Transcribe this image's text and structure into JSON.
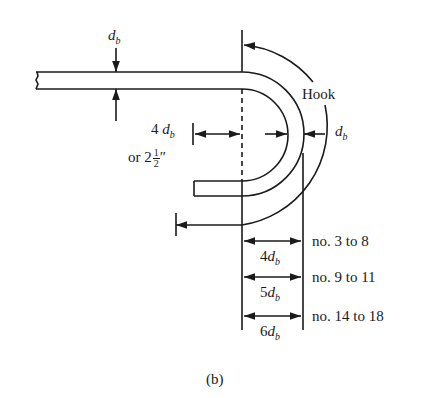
{
  "figure": {
    "panel_label": "(b)",
    "bar_diameter_symbol": "d",
    "bar_diameter_subscript": "b",
    "hook_label": "Hook",
    "extension": {
      "coefficient": "4",
      "alternative_prefix": "or 2",
      "alternative_fraction_num": "1",
      "alternative_fraction_den": "2",
      "alternative_unit": "″"
    },
    "bend_diameters": [
      {
        "coefficient": "4",
        "bar_sizes": "no. 3 to 8"
      },
      {
        "coefficient": "5",
        "bar_sizes": "no. 9 to 11"
      },
      {
        "coefficient": "6",
        "bar_sizes": "no. 14 to 18"
      }
    ],
    "colors": {
      "line": "#1a1a1a",
      "background": "#ffffff"
    }
  }
}
